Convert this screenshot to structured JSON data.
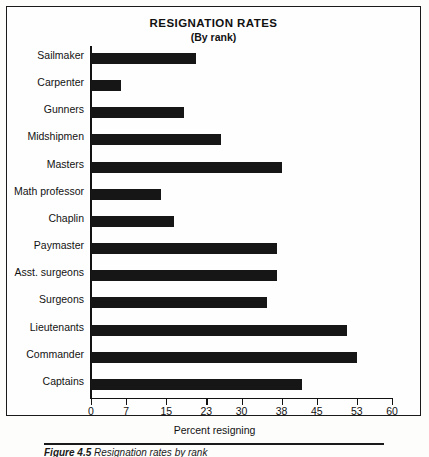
{
  "figure": {
    "caption_label": "Figure 4.5",
    "caption_text": "Resignation rates by rank"
  },
  "chart_data": {
    "type": "bar",
    "orientation": "horizontal",
    "title": "RESIGNATION RATES",
    "subtitle": "(By rank)",
    "xlabel": "Percent resigning",
    "ylabel": "",
    "xlim": [
      0,
      60
    ],
    "xticks": [
      0,
      7,
      15,
      23,
      30,
      38,
      45,
      53,
      60
    ],
    "xticklabels": [
      "0",
      "7",
      "15",
      "23",
      "30",
      "38",
      "45",
      "53",
      "60"
    ],
    "grid": false,
    "legend": null,
    "bar_color": "#161616",
    "categories": [
      "Sailmaker",
      "Carpenter",
      "Gunners",
      "Midshipmen",
      "Masters",
      "Math professor",
      "Chaplin",
      "Paymaster",
      "Asst. surgeons",
      "Surgeons",
      "Lieutenants",
      "Commander",
      "Captains"
    ],
    "values": [
      21,
      6,
      18.5,
      26,
      38,
      14,
      16.5,
      37,
      37,
      35,
      51,
      53,
      42
    ]
  }
}
